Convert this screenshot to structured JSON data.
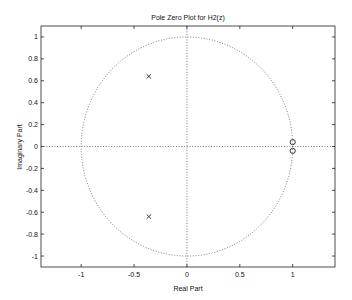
{
  "chart_data": {
    "type": "scatter",
    "title": "Pole Zero Plot for H2(z)",
    "xlabel": "Real Part",
    "ylabel": "Imaginary Part",
    "xlim": [
      -1.38,
      1.4
    ],
    "ylim": [
      -1.1,
      1.1
    ],
    "grid": false,
    "legend": null,
    "x_ticks": [
      -1,
      -0.5,
      0,
      0.5,
      1
    ],
    "x_tick_labels": [
      "-1",
      "-0.5",
      "0",
      "0.5",
      "1"
    ],
    "y_ticks": [
      1,
      0.8,
      0.6,
      0.4,
      0.2,
      0,
      -0.2,
      -0.4,
      -0.6,
      -0.8,
      -1
    ],
    "y_tick_labels": [
      "1",
      "0.8",
      "0.6",
      "0.4",
      "0.2",
      "0",
      "-0.2",
      "-0.4",
      "-0.6",
      "-0.8",
      "-1"
    ],
    "series": [
      {
        "name": "poles",
        "marker": "x",
        "points": [
          [
            -0.36,
            0.64
          ],
          [
            -0.36,
            -0.64
          ]
        ]
      },
      {
        "name": "zeros",
        "marker": "o",
        "points": [
          [
            1.0,
            0.04
          ],
          [
            1.0,
            -0.04
          ]
        ]
      }
    ],
    "annotations": [
      {
        "type": "unit-circle",
        "style": "dotted",
        "center": [
          0,
          0
        ],
        "radius": 1
      },
      {
        "type": "real-axis-line",
        "style": "dotted",
        "y": 0
      },
      {
        "type": "imag-axis-line",
        "style": "dotted",
        "x": 0
      }
    ]
  },
  "layout": {
    "frame": {
      "left": 41,
      "right": 335,
      "top": 26,
      "bottom": 267
    },
    "colors": {
      "line": "#222222",
      "dotted": "#444444",
      "background": "#ffffff"
    }
  }
}
